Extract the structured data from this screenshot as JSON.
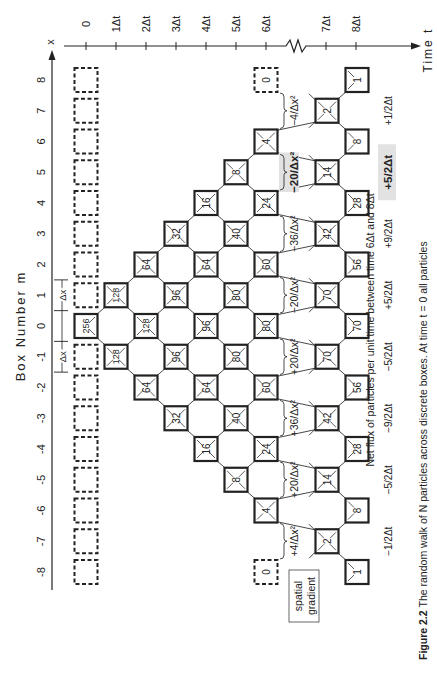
{
  "axes": {
    "box_axis": {
      "label": "Box Number m",
      "symbol": "x",
      "ticks": [
        "-8",
        "-7",
        "-6",
        "-5",
        "-4",
        "-3",
        "-2",
        "-1",
        "0",
        "1",
        "2",
        "3",
        "4",
        "5",
        "6",
        "7",
        "8"
      ]
    },
    "time_axis": {
      "label": "Time t",
      "ticks": [
        {
          "t": 0,
          "label": "0"
        },
        {
          "t": 1,
          "label": "1Δt"
        },
        {
          "t": 2,
          "label": "2Δt"
        },
        {
          "t": 3,
          "label": "3Δt"
        },
        {
          "t": 4,
          "label": "4Δt"
        },
        {
          "t": 5,
          "label": "5Δt"
        },
        {
          "t": 6,
          "label": "6Δt"
        },
        {
          "t": 7,
          "label": "7Δt"
        },
        {
          "t": 8,
          "label": "8Δt"
        }
      ],
      "break_between": [
        "6Δt",
        "7Δt"
      ]
    },
    "dx_label": "Δx"
  },
  "columns": [
    {
      "t": 0,
      "boxes": [
        {
          "m": 0,
          "n": "256"
        }
      ]
    },
    {
      "t": 1,
      "boxes": [
        {
          "m": -1,
          "n": "128"
        },
        {
          "m": 1,
          "n": "128"
        }
      ]
    },
    {
      "t": 2,
      "boxes": [
        {
          "m": -2,
          "n": "64"
        },
        {
          "m": 0,
          "n": "128"
        },
        {
          "m": 2,
          "n": "64"
        }
      ]
    },
    {
      "t": 3,
      "boxes": [
        {
          "m": -3,
          "n": "32"
        },
        {
          "m": -1,
          "n": "96"
        },
        {
          "m": 1,
          "n": "96"
        },
        {
          "m": 3,
          "n": "32"
        }
      ]
    },
    {
      "t": 4,
      "boxes": [
        {
          "m": -4,
          "n": "16"
        },
        {
          "m": -2,
          "n": "64"
        },
        {
          "m": 0,
          "n": "96"
        },
        {
          "m": 2,
          "n": "64"
        },
        {
          "m": 4,
          "n": "16"
        }
      ]
    },
    {
      "t": 5,
      "boxes": [
        {
          "m": -5,
          "n": "8"
        },
        {
          "m": -3,
          "n": "40"
        },
        {
          "m": -1,
          "n": "80"
        },
        {
          "m": 1,
          "n": "80"
        },
        {
          "m": 3,
          "n": "40"
        },
        {
          "m": 5,
          "n": "8"
        }
      ]
    },
    {
      "t": 6,
      "boxes": [
        {
          "m": -6,
          "n": "4"
        },
        {
          "m": -4,
          "n": "24"
        },
        {
          "m": -2,
          "n": "60"
        },
        {
          "m": 0,
          "n": "80"
        },
        {
          "m": 2,
          "n": "60"
        },
        {
          "m": 4,
          "n": "24"
        },
        {
          "m": 6,
          "n": "4"
        }
      ],
      "empty": [
        {
          "m": -8,
          "n": "0"
        },
        {
          "m": 8,
          "n": "0"
        }
      ]
    },
    {
      "t": 7,
      "boxes": [
        {
          "m": -7,
          "n": "2"
        },
        {
          "m": -5,
          "n": "14"
        },
        {
          "m": -3,
          "n": "42"
        },
        {
          "m": -1,
          "n": "70"
        },
        {
          "m": 1,
          "n": "70"
        },
        {
          "m": 3,
          "n": "42"
        },
        {
          "m": 5,
          "n": "14",
          "bold": true
        },
        {
          "m": 7,
          "n": "2"
        }
      ]
    },
    {
      "t": 8,
      "boxes": [
        {
          "m": -8,
          "n": "1"
        },
        {
          "m": -6,
          "n": "8"
        },
        {
          "m": -4,
          "n": "28"
        },
        {
          "m": -2,
          "n": "56"
        },
        {
          "m": 0,
          "n": "70"
        },
        {
          "m": 2,
          "n": "56"
        },
        {
          "m": 4,
          "n": "28"
        },
        {
          "m": 6,
          "n": "8"
        },
        {
          "m": 8,
          "n": "1"
        }
      ]
    }
  ],
  "spatial_gradient": {
    "label_line1": "spatial",
    "label_line2": "gradient",
    "values": [
      {
        "m_from": -8,
        "m_to": -6,
        "text": "+4/Δx²"
      },
      {
        "m_from": -6,
        "m_to": -4,
        "text": "+20/Δx²"
      },
      {
        "m_from": -4,
        "m_to": -2,
        "text": "+36/Δx²"
      },
      {
        "m_from": -2,
        "m_to": 0,
        "text": "+20/Δx²"
      },
      {
        "m_from": 0,
        "m_to": 2,
        "text": "−20/Δx²"
      },
      {
        "m_from": 2,
        "m_to": 4,
        "text": "−36/Δx²"
      },
      {
        "m_from": 4,
        "m_to": 6,
        "text": "−20/Δx²",
        "highlight": true
      },
      {
        "m_from": 6,
        "m_to": 8,
        "text": "−4/Δx²"
      }
    ]
  },
  "net_flux": {
    "title": "Net flux of particles per unit time between time 6Δt and 8Δt",
    "values": [
      {
        "m": -7,
        "text": "−1/2Δt"
      },
      {
        "m": -5,
        "text": "−5/2Δt"
      },
      {
        "m": -3,
        "text": "−9/2Δt"
      },
      {
        "m": -1,
        "text": "−5/2Δt"
      },
      {
        "m": 1,
        "text": "+5/2Δt"
      },
      {
        "m": 3,
        "text": "+9/2Δt"
      },
      {
        "m": 5,
        "text": "+5/2Δt",
        "highlight": true
      },
      {
        "m": 7,
        "text": "+1/2Δt"
      }
    ]
  },
  "caption": {
    "label": "Figure 2.2",
    "text": "The random walk of N particles across discrete boxes. At time t = 0 all particles"
  }
}
